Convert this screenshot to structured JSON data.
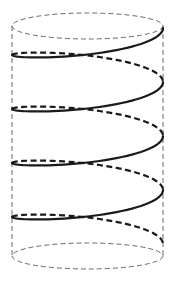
{
  "diagram": {
    "colors": {
      "background": "#ffffff",
      "cylinder_outline": "#6a6a6a",
      "helix": "#1a1a1a"
    },
    "cylinder": {
      "cx": 87.5,
      "rx": 75.5,
      "ry": 13,
      "top_y": 26,
      "bottom_y": 256,
      "style": "dashed"
    },
    "helix": {
      "turns": 4,
      "start_y": 28,
      "pitch": 54,
      "front_style": "solid",
      "back_style": "dashed"
    }
  }
}
